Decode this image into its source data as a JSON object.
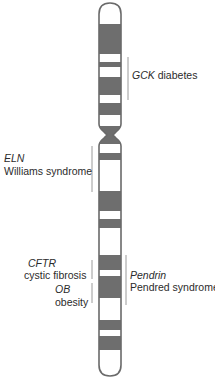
{
  "diagram": {
    "type": "chromosome-ideogram",
    "colors": {
      "dark_band": "#6e6e6e",
      "light_band": "#ffffff",
      "outline": "#6a6a6a",
      "bracket": "#9a9a9a",
      "text": "#2b2b2b"
    },
    "bands": [
      {
        "y0": 24,
        "y1": 54
      },
      {
        "y0": 62,
        "y1": 67
      },
      {
        "y0": 77,
        "y1": 95
      },
      {
        "y0": 103,
        "y1": 115
      },
      {
        "y0": 153,
        "y1": 160
      },
      {
        "y0": 191,
        "y1": 211
      },
      {
        "y0": 219,
        "y1": 228
      },
      {
        "y0": 255,
        "y1": 270
      },
      {
        "y0": 276,
        "y1": 298
      },
      {
        "y0": 320,
        "y1": 330
      },
      {
        "y0": 336,
        "y1": 350
      }
    ],
    "annotations": [
      {
        "side": "right",
        "gene": "GCK",
        "gene_inline": true,
        "disease": "diabetes"
      },
      {
        "side": "left",
        "gene": "ELN",
        "disease": "Williams syndrome"
      },
      {
        "side": "left",
        "gene": "CFTR",
        "disease": "cystic fibrosis"
      },
      {
        "side": "left",
        "gene": "OB",
        "disease": "obesity"
      },
      {
        "side": "right",
        "gene": "Pendrin",
        "disease": "Pendred syndrome"
      }
    ]
  }
}
